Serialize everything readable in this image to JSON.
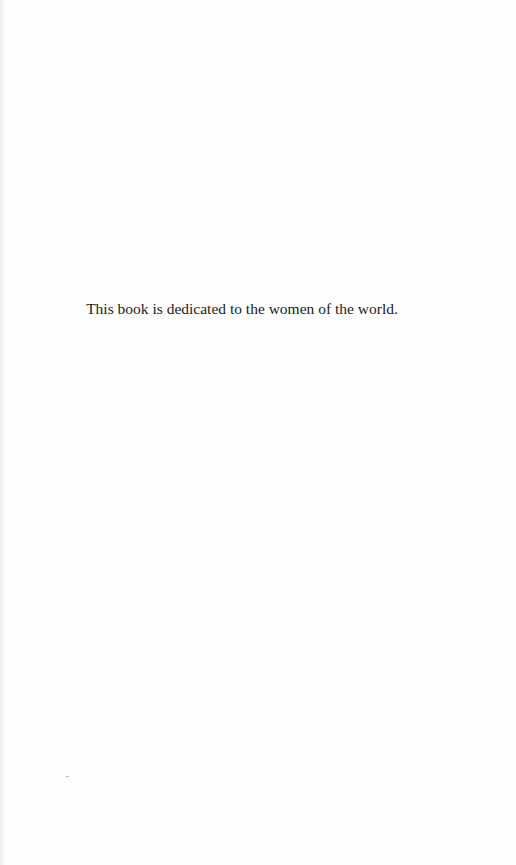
{
  "page": {
    "dedication": "This book is dedicated to the women of the world."
  }
}
